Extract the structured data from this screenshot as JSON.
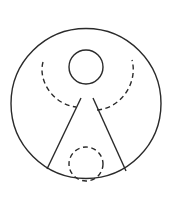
{
  "figure": {
    "width": 169,
    "height": 203,
    "background": "#ffffff",
    "stroke": "#2a2a2a",
    "stroke_width": 1.4,
    "dash": "5 3.5",
    "outer_circle": {
      "cx": 86,
      "cy": 103.5,
      "r": 75
    },
    "head_circle": {
      "cx": 86,
      "cy": 67,
      "r": 17
    },
    "arms_arc": {
      "d": "M 43 62 C 38 80, 52 104, 76 107 M 97 110 C 122 108, 138 82, 132 60"
    },
    "left_line": {
      "x1": 81,
      "y1": 98,
      "x2": 47,
      "y2": 169
    },
    "right_line": {
      "x1": 93,
      "y1": 98,
      "x2": 126,
      "y2": 171
    },
    "bottom_dashed_circle": {
      "cx": 86,
      "cy": 164,
      "r": 17
    }
  }
}
